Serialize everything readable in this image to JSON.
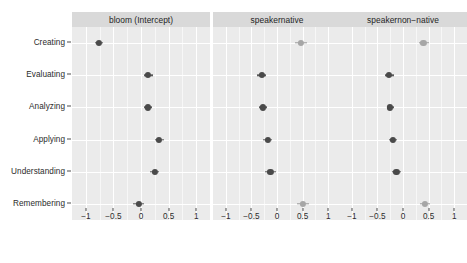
{
  "chart_data": {
    "type": "scatter",
    "title": "",
    "xlabel": "",
    "ylabel": "",
    "xlim": [
      -1.25,
      1.25
    ],
    "grid": true,
    "legend": "none",
    "x_ticks": [
      "-1",
      "-0.5",
      "0",
      "0.5",
      "1"
    ],
    "x_tick_values": [
      -1,
      -0.5,
      0,
      0.5,
      1
    ],
    "categories": [
      "Creating",
      "Evaluating",
      "Analyzing",
      "Applying",
      "Understanding",
      "Remembering"
    ],
    "panels": [
      {
        "label": "bloom (Intercept)",
        "points": [
          {
            "category": "Creating",
            "estimate": -0.76,
            "low": -0.83,
            "high": -0.68,
            "shade": "dark"
          },
          {
            "category": "Evaluating",
            "estimate": 0.13,
            "low": 0.06,
            "high": 0.21,
            "shade": "dark"
          },
          {
            "category": "Analyzing",
            "estimate": 0.12,
            "low": 0.05,
            "high": 0.2,
            "shade": "dark"
          },
          {
            "category": "Applying",
            "estimate": 0.33,
            "low": 0.25,
            "high": 0.41,
            "shade": "dark"
          },
          {
            "category": "Understanding",
            "estimate": 0.25,
            "low": 0.16,
            "high": 0.33,
            "shade": "dark"
          },
          {
            "category": "Remembering",
            "estimate": -0.04,
            "low": -0.14,
            "high": 0.06,
            "shade": "dark"
          }
        ]
      },
      {
        "label": "speakernative",
        "points": [
          {
            "category": "Creating",
            "estimate": 0.47,
            "low": 0.36,
            "high": 0.59,
            "shade": "light"
          },
          {
            "category": "Evaluating",
            "estimate": -0.3,
            "low": -0.4,
            "high": -0.21,
            "shade": "dark"
          },
          {
            "category": "Analyzing",
            "estimate": -0.28,
            "low": -0.36,
            "high": -0.19,
            "shade": "dark"
          },
          {
            "category": "Applying",
            "estimate": -0.18,
            "low": -0.27,
            "high": -0.1,
            "shade": "dark"
          },
          {
            "category": "Understanding",
            "estimate": -0.13,
            "low": -0.23,
            "high": -0.02,
            "shade": "dark"
          },
          {
            "category": "Remembering",
            "estimate": 0.5,
            "low": 0.39,
            "high": 0.62,
            "shade": "light"
          }
        ]
      },
      {
        "label": "speakernon−native",
        "points": [
          {
            "category": "Creating",
            "estimate": 0.4,
            "low": 0.32,
            "high": 0.5,
            "shade": "light"
          },
          {
            "category": "Evaluating",
            "estimate": -0.27,
            "low": -0.36,
            "high": -0.18,
            "shade": "dark"
          },
          {
            "category": "Analyzing",
            "estimate": -0.25,
            "low": -0.32,
            "high": -0.17,
            "shade": "dark"
          },
          {
            "category": "Applying",
            "estimate": -0.2,
            "low": -0.28,
            "high": -0.12,
            "shade": "dark"
          },
          {
            "category": "Understanding",
            "estimate": -0.13,
            "low": -0.22,
            "high": -0.03,
            "shade": "dark"
          },
          {
            "category": "Remembering",
            "estimate": 0.43,
            "low": 0.34,
            "high": 0.53,
            "shade": "light"
          }
        ]
      }
    ],
    "colors": {
      "panel_background": "#ebebeb",
      "strip_background": "#d9d9d9",
      "gridline": "#ffffff",
      "point_dark": "#4a4a4a",
      "point_light": "#a6a6a6",
      "text": "#2b2b2b"
    }
  }
}
